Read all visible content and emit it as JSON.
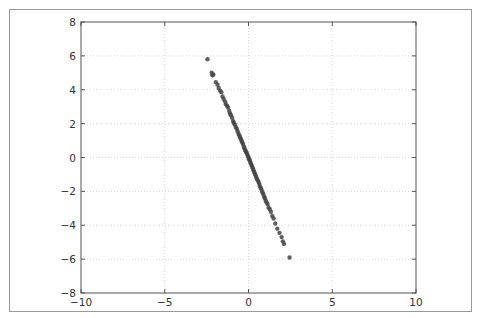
{
  "chart_data": {
    "type": "scatter",
    "title": "",
    "xlabel": "",
    "ylabel": "",
    "xlim": [
      -10,
      10
    ],
    "ylim": [
      -8,
      8
    ],
    "grid": true,
    "legend": null,
    "xticks": [
      -10,
      -5,
      0,
      5,
      10
    ],
    "yticks": [
      -8,
      -6,
      -4,
      -2,
      0,
      2,
      4,
      6,
      8
    ],
    "xtick_labels": [
      "−10",
      "−5",
      "0",
      "5",
      "10"
    ],
    "ytick_labels": [
      "−8",
      "−6",
      "−4",
      "−2",
      "0",
      "2",
      "4",
      "6",
      "8"
    ],
    "marker_color": "#444444",
    "series": [
      {
        "name": "points",
        "x": [
          -2.45,
          -2.2,
          -2.15,
          -2.1,
          -1.95,
          -1.85,
          -1.78,
          -1.7,
          -1.62,
          -1.55,
          -1.48,
          -1.4,
          -1.35,
          -1.28,
          -1.22,
          -1.15,
          -1.1,
          -1.05,
          -0.98,
          -0.92,
          -0.88,
          -0.82,
          -0.76,
          -0.7,
          -0.65,
          -0.6,
          -0.55,
          -0.5,
          -0.46,
          -0.42,
          -0.38,
          -0.33,
          -0.28,
          -0.24,
          -0.2,
          -0.16,
          -0.12,
          -0.08,
          -0.04,
          0.0,
          0.03,
          0.07,
          0.1,
          0.14,
          0.18,
          0.22,
          0.26,
          0.3,
          0.34,
          0.38,
          0.42,
          0.46,
          0.5,
          0.55,
          0.6,
          0.64,
          0.68,
          0.73,
          0.78,
          0.83,
          0.88,
          0.93,
          0.98,
          1.03,
          1.08,
          1.14,
          1.2,
          1.27,
          1.34,
          1.42,
          1.5,
          1.6,
          1.72,
          1.85,
          1.98,
          2.05,
          2.12,
          2.45
        ],
        "y": [
          5.8,
          5.0,
          4.85,
          4.9,
          4.45,
          4.3,
          4.1,
          3.95,
          3.85,
          3.6,
          3.45,
          3.3,
          3.15,
          3.05,
          2.95,
          2.75,
          2.6,
          2.5,
          2.35,
          2.15,
          2.05,
          1.95,
          1.8,
          1.7,
          1.55,
          1.4,
          1.3,
          1.2,
          1.1,
          1.0,
          0.9,
          0.8,
          0.65,
          0.55,
          0.45,
          0.35,
          0.3,
          0.2,
          0.1,
          0.0,
          -0.1,
          -0.15,
          -0.25,
          -0.35,
          -0.45,
          -0.55,
          -0.65,
          -0.75,
          -0.85,
          -0.95,
          -1.05,
          -1.15,
          -1.25,
          -1.35,
          -1.45,
          -1.55,
          -1.7,
          -1.8,
          -1.9,
          -2.05,
          -2.15,
          -2.3,
          -2.4,
          -2.55,
          -2.65,
          -2.75,
          -2.95,
          -3.05,
          -3.2,
          -3.45,
          -3.6,
          -3.9,
          -4.2,
          -4.45,
          -4.7,
          -4.95,
          -5.1,
          -5.9
        ]
      }
    ]
  }
}
